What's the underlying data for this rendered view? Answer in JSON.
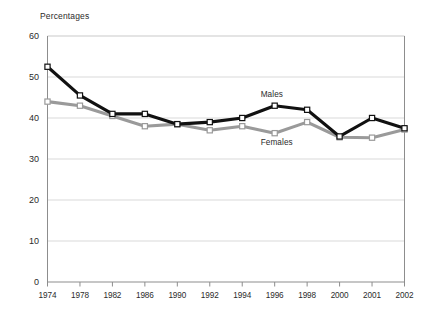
{
  "chart_data": {
    "type": "line",
    "title": "",
    "ylabel": "Percentages",
    "xlabel": "",
    "categories": [
      "1974",
      "1978",
      "1982",
      "1986",
      "1990",
      "1992",
      "1994",
      "1996",
      "1998",
      "2000",
      "2001",
      "2002"
    ],
    "series": [
      {
        "name": "Males",
        "color": "#111111",
        "marker": "open-square",
        "values": [
          52.5,
          45.5,
          41.0,
          41.0,
          38.5,
          39.0,
          40.0,
          43.0,
          42.0,
          35.5,
          40.0,
          37.5
        ]
      },
      {
        "name": "Females",
        "color": "#9a9a9a",
        "marker": "open-square",
        "values": [
          44.0,
          43.0,
          40.5,
          38.0,
          38.5,
          37.0,
          38.0,
          36.3,
          39.0,
          35.3,
          35.2,
          37.2
        ]
      }
    ],
    "ylim": [
      0,
      60
    ],
    "yticks": [
      0,
      10,
      20,
      30,
      40,
      50,
      60
    ],
    "ytick_labels": [
      "0",
      "10",
      "20",
      "30",
      "40",
      "50",
      "60"
    ],
    "grid": true,
    "grid_color": "#c9c9c9",
    "legend_position": "inline-annotations",
    "annotations": [
      {
        "text": "Males",
        "x_index": 7,
        "value": 45.5
      },
      {
        "text": "Females",
        "x_index": 7,
        "value": 33.8
      }
    ]
  },
  "axis": {
    "y_title": "Percentages"
  }
}
